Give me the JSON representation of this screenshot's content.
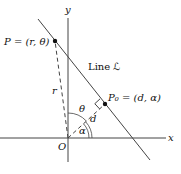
{
  "diagram": {
    "axes": {
      "x_label": "x",
      "y_label": "y",
      "origin_label": "O"
    },
    "line_label": "Line ℒ",
    "point_P": "P = (r, θ)",
    "point_P0": "P₀ = (d, α)",
    "segment_r": "r",
    "segment_d": "d",
    "angle_theta": "θ",
    "angle_alpha": "α",
    "colors": {
      "stroke": "#333333",
      "background": "#ffffff"
    }
  }
}
